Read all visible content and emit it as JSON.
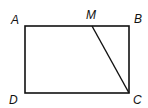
{
  "diagram": {
    "type": "geometry",
    "shape": "rectangle",
    "stroke_color": "#111111",
    "points": {
      "A": {
        "label": "A",
        "x": 25,
        "y": 26
      },
      "B": {
        "label": "B",
        "x": 129,
        "y": 26
      },
      "C": {
        "label": "C",
        "x": 129,
        "y": 93
      },
      "D": {
        "label": "D",
        "x": 25,
        "y": 93
      },
      "M": {
        "label": "M",
        "x": 92,
        "y": 26
      }
    },
    "segments": [
      "AB",
      "BC",
      "CD",
      "DA",
      "MC"
    ]
  }
}
